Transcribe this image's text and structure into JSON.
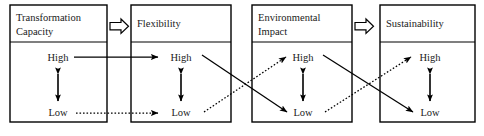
{
  "diagram": {
    "canvas": {
      "width": 484,
      "height": 136
    },
    "colors": {
      "stroke": "#000000",
      "text": "#1a1a1a",
      "background": "#ffffff"
    },
    "boxes": [
      {
        "id": "transformation-capacity",
        "title": "Transformation\nCapacity",
        "title_line1": "Transformation",
        "title_line2": "Capacity",
        "high_label": "High",
        "low_label": "Low",
        "x": 10,
        "y": 5,
        "width": 97,
        "height": 117,
        "header_height": 37
      },
      {
        "id": "flexibility",
        "title": "Flexibility",
        "title_line1": "Flexibility",
        "title_line2": "",
        "high_label": "High",
        "low_label": "Low",
        "x": 131,
        "y": 5,
        "width": 100,
        "height": 117,
        "header_height": 37
      },
      {
        "id": "environmental-impact",
        "title": "Environmental\nImpact",
        "title_line1": "Environmental",
        "title_line2": "Impact",
        "high_label": "High",
        "low_label": "Low",
        "x": 252,
        "y": 5,
        "width": 100,
        "height": 117,
        "header_height": 37
      },
      {
        "id": "sustainability",
        "title": "Sustainability",
        "title_line1": "Sustainability",
        "title_line2": "",
        "high_label": "High",
        "low_label": "Low",
        "x": 380,
        "y": 5,
        "width": 95,
        "height": 117,
        "header_height": 37
      }
    ],
    "block_arrows": [
      {
        "id": "block-arrow-1",
        "from": "transformation-capacity",
        "to": "flexibility",
        "x": 110,
        "y": 19
      },
      {
        "id": "block-arrow-2",
        "from": "environmental-impact",
        "to": "sustainability",
        "x": 355,
        "y": 19
      }
    ],
    "links": [
      {
        "id": "tc-high-to-flex-high",
        "style": "solid",
        "from": "transformation-capacity.High",
        "to": "flexibility.High"
      },
      {
        "id": "tc-low-to-flex-low",
        "style": "dotted",
        "from": "transformation-capacity.Low",
        "to": "flexibility.Low"
      },
      {
        "id": "flex-high-to-env-low",
        "style": "solid",
        "from": "flexibility.High",
        "to": "environmental-impact.Low"
      },
      {
        "id": "flex-low-to-env-high",
        "style": "dotted",
        "from": "flexibility.Low",
        "to": "environmental-impact.High"
      },
      {
        "id": "env-high-to-sus-low",
        "style": "solid",
        "from": "environmental-impact.High",
        "to": "sustainability.Low"
      },
      {
        "id": "env-low-to-sus-high",
        "style": "dotted",
        "from": "environmental-impact.Low",
        "to": "sustainability.High"
      }
    ],
    "internal_double_arrows": [
      {
        "id": "range-transformation-capacity",
        "box": "transformation-capacity"
      },
      {
        "id": "range-flexibility",
        "box": "flexibility"
      },
      {
        "id": "range-environmental-impact",
        "box": "environmental-impact"
      },
      {
        "id": "range-sustainability",
        "box": "sustainability"
      }
    ]
  }
}
